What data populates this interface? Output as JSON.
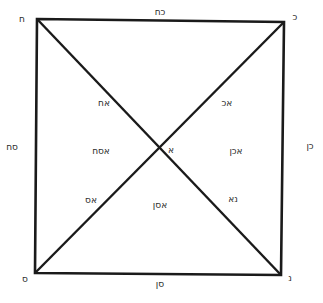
{
  "diagram": {
    "type": "square-with-diagonals",
    "line_color": "#1a1a1a",
    "background": "#ffffff",
    "geometry": {
      "top_left": [
        37,
        19
      ],
      "top_right": [
        284,
        22
      ],
      "bottom_right": [
        281,
        275
      ],
      "bottom_left": [
        35,
        273
      ],
      "center": [
        160,
        147
      ]
    },
    "corners": {
      "top_left": "ח",
      "top_right": "כ",
      "bottom_right": "נ",
      "bottom_left": "ס"
    },
    "center_label": "א",
    "edges": {
      "top": "כח",
      "right": "כן",
      "bottom": "סן",
      "left": "סח"
    },
    "half_diagonals": {
      "upper_left": "אח",
      "upper_right": "אכ",
      "lower_right": "נא",
      "lower_left": "אס"
    },
    "triangles": {
      "left": "אסח",
      "right": "אכן",
      "bottom": "אסן"
    }
  }
}
